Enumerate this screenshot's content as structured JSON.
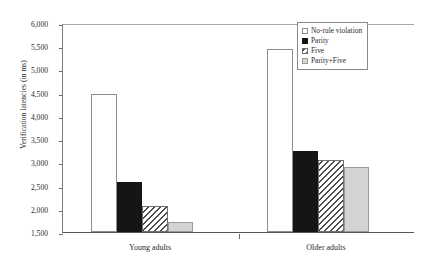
{
  "chart_data": {
    "type": "bar",
    "title": "",
    "xlabel": "",
    "ylabel": "Verification latencies (in ms)",
    "categories": [
      "Young adults",
      "Older adults"
    ],
    "series": [
      {
        "name": "No-rule violation",
        "values": [
          4470,
          5430
        ],
        "fill": "white"
      },
      {
        "name": "Parity",
        "values": [
          2570,
          3250
        ],
        "fill": "black"
      },
      {
        "name": "Five",
        "values": [
          2070,
          3040
        ],
        "fill": "hatch"
      },
      {
        "name": "Parity+Five",
        "values": [
          1720,
          2900
        ],
        "fill": "gray"
      }
    ],
    "ylim": [
      1500,
      6000
    ],
    "ytick_step": 500,
    "ytick_labels": [
      "6,000",
      "5,500",
      "5,000",
      "4,500",
      "4,000",
      "3,500",
      "3,000",
      "2,500",
      "2,000",
      "1,500"
    ],
    "ytick_values": [
      6000,
      5500,
      5000,
      4500,
      4000,
      3500,
      3000,
      2500,
      2000,
      1500
    ],
    "grid": false,
    "legend_position": "top-right"
  },
  "legend": {
    "entries": [
      {
        "label": "No-rule violation",
        "fill": "white"
      },
      {
        "label": "Parity",
        "fill": "black"
      },
      {
        "label": "Five",
        "fill": "hatch"
      },
      {
        "label": "Parity+Five",
        "fill": "gray"
      }
    ]
  },
  "colors": {
    "white_fill": "#ffffff",
    "black_fill": "#151515",
    "hatch_line": "#4a4a4a",
    "gray_fill": "#d4d4d4",
    "axis": "#555555"
  }
}
